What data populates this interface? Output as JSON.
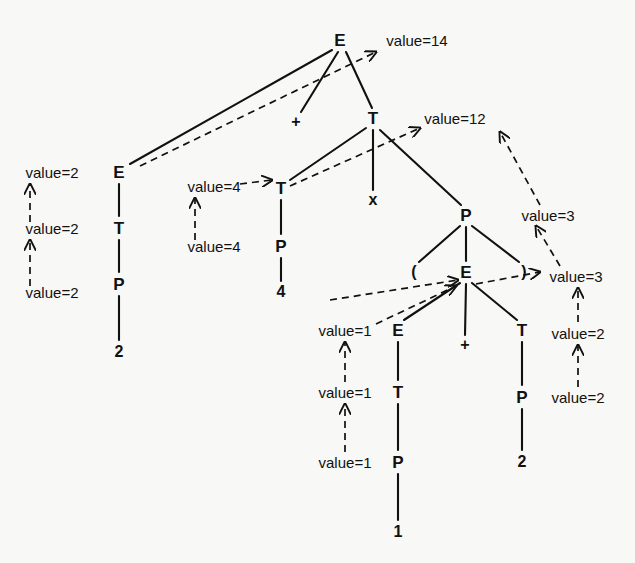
{
  "diagram": {
    "background_color": "#f8f8f6",
    "ink_color": "#111111"
  },
  "nodes": [
    {
      "id": "n1",
      "label": "E",
      "kind": "nonterminal",
      "x": 340,
      "y": 40
    },
    {
      "id": "n2",
      "label": "E",
      "kind": "nonterminal",
      "x": 119,
      "y": 172
    },
    {
      "id": "n3",
      "label": "+",
      "kind": "terminal",
      "x": 296,
      "y": 122
    },
    {
      "id": "n4",
      "label": "T",
      "kind": "nonterminal",
      "x": 373,
      "y": 118
    },
    {
      "id": "n5",
      "label": "T",
      "kind": "nonterminal",
      "x": 119,
      "y": 228
    },
    {
      "id": "n6",
      "label": "P",
      "kind": "nonterminal",
      "x": 119,
      "y": 284
    },
    {
      "id": "n7",
      "label": "2",
      "kind": "terminal",
      "x": 119,
      "y": 352
    },
    {
      "id": "n8",
      "label": "T",
      "kind": "nonterminal",
      "x": 281,
      "y": 188
    },
    {
      "id": "n9",
      "label": "x",
      "kind": "terminal",
      "x": 373,
      "y": 200
    },
    {
      "id": "n10",
      "label": "P",
      "kind": "nonterminal",
      "x": 466,
      "y": 215
    },
    {
      "id": "n11",
      "label": "P",
      "kind": "nonterminal",
      "x": 281,
      "y": 246
    },
    {
      "id": "n12",
      "label": "4",
      "kind": "terminal",
      "x": 281,
      "y": 292
    },
    {
      "id": "n13",
      "label": "(",
      "kind": "terminal",
      "x": 414,
      "y": 272
    },
    {
      "id": "n14",
      "label": "E",
      "kind": "nonterminal",
      "x": 466,
      "y": 272
    },
    {
      "id": "n15",
      "label": ")",
      "kind": "terminal",
      "x": 524,
      "y": 272
    },
    {
      "id": "n16",
      "label": "E",
      "kind": "nonterminal",
      "x": 398,
      "y": 330
    },
    {
      "id": "n17",
      "label": "+",
      "kind": "terminal",
      "x": 465,
      "y": 345
    },
    {
      "id": "n18",
      "label": "T",
      "kind": "nonterminal",
      "x": 522,
      "y": 330
    },
    {
      "id": "n19",
      "label": "T",
      "kind": "nonterminal",
      "x": 398,
      "y": 392
    },
    {
      "id": "n20",
      "label": "P",
      "kind": "nonterminal",
      "x": 522,
      "y": 397
    },
    {
      "id": "n21",
      "label": "P",
      "kind": "nonterminal",
      "x": 398,
      "y": 462
    },
    {
      "id": "n22",
      "label": "2",
      "kind": "terminal",
      "x": 522,
      "y": 462
    },
    {
      "id": "n23",
      "label": "1",
      "kind": "terminal",
      "x": 398,
      "y": 532
    }
  ],
  "annotations": [
    {
      "id": "a1",
      "text": "value=14",
      "x": 417,
      "y": 40
    },
    {
      "id": "a2",
      "text": "value=12",
      "x": 455,
      "y": 118
    },
    {
      "id": "a3",
      "text": "value=2",
      "x": 52,
      "y": 172
    },
    {
      "id": "a4",
      "text": "value=2",
      "x": 52,
      "y": 228
    },
    {
      "id": "a5",
      "text": "value=2",
      "x": 52,
      "y": 292
    },
    {
      "id": "a6",
      "text": "value=4",
      "x": 214,
      "y": 186
    },
    {
      "id": "a7",
      "text": "value=4",
      "x": 214,
      "y": 246
    },
    {
      "id": "a8",
      "text": "value=3",
      "x": 548,
      "y": 215
    },
    {
      "id": "a9",
      "text": "value=3",
      "x": 576,
      "y": 276
    },
    {
      "id": "a10",
      "text": "value=1",
      "x": 345,
      "y": 330
    },
    {
      "id": "a11",
      "text": "value=2",
      "x": 578,
      "y": 333
    },
    {
      "id": "a12",
      "text": "value=1",
      "x": 345,
      "y": 392
    },
    {
      "id": "a13",
      "text": "value=2",
      "x": 578,
      "y": 397
    },
    {
      "id": "a14",
      "text": "value=1",
      "x": 345,
      "y": 462
    }
  ],
  "tree_edges": [
    {
      "from": "n1",
      "to": "n2",
      "x1": 332,
      "y1": 50,
      "x2": 130,
      "y2": 164
    },
    {
      "from": "n1",
      "to": "n3",
      "x1": 338,
      "y1": 52,
      "x2": 301,
      "y2": 112
    },
    {
      "from": "n1",
      "to": "n4",
      "x1": 346,
      "y1": 52,
      "x2": 372,
      "y2": 108
    },
    {
      "from": "n2",
      "to": "n5",
      "x1": 119,
      "y1": 184,
      "x2": 119,
      "y2": 216
    },
    {
      "from": "n5",
      "to": "n6",
      "x1": 119,
      "y1": 240,
      "x2": 119,
      "y2": 272
    },
    {
      "from": "n6",
      "to": "n7",
      "x1": 119,
      "y1": 296,
      "x2": 119,
      "y2": 340
    },
    {
      "from": "n4",
      "to": "n8",
      "x1": 366,
      "y1": 128,
      "x2": 290,
      "y2": 180
    },
    {
      "from": "n4",
      "to": "n9",
      "x1": 373,
      "y1": 130,
      "x2": 373,
      "y2": 190
    },
    {
      "from": "n4",
      "to": "n10",
      "x1": 380,
      "y1": 130,
      "x2": 461,
      "y2": 205
    },
    {
      "from": "n8",
      "to": "n11",
      "x1": 281,
      "y1": 200,
      "x2": 281,
      "y2": 234
    },
    {
      "from": "n11",
      "to": "n12",
      "x1": 281,
      "y1": 258,
      "x2": 281,
      "y2": 281
    },
    {
      "from": "n10",
      "to": "n13",
      "x1": 460,
      "y1": 226,
      "x2": 419,
      "y2": 262
    },
    {
      "from": "n10",
      "to": "n14",
      "x1": 466,
      "y1": 227,
      "x2": 466,
      "y2": 261
    },
    {
      "from": "n10",
      "to": "n15",
      "x1": 472,
      "y1": 226,
      "x2": 519,
      "y2": 262
    },
    {
      "from": "n14",
      "to": "n16",
      "x1": 460,
      "y1": 283,
      "x2": 404,
      "y2": 320
    },
    {
      "from": "n14",
      "to": "n17",
      "x1": 466,
      "y1": 284,
      "x2": 465,
      "y2": 335
    },
    {
      "from": "n14",
      "to": "n18",
      "x1": 472,
      "y1": 283,
      "x2": 517,
      "y2": 320
    },
    {
      "from": "n16",
      "to": "n19",
      "x1": 398,
      "y1": 342,
      "x2": 398,
      "y2": 380
    },
    {
      "from": "n19",
      "to": "n21",
      "x1": 398,
      "y1": 404,
      "x2": 398,
      "y2": 450
    },
    {
      "from": "n21",
      "to": "n23",
      "x1": 398,
      "y1": 474,
      "x2": 398,
      "y2": 520
    },
    {
      "from": "n18",
      "to": "n20",
      "x1": 522,
      "y1": 342,
      "x2": 522,
      "y2": 385
    },
    {
      "from": "n20",
      "to": "n22",
      "x1": 522,
      "y1": 409,
      "x2": 522,
      "y2": 450
    }
  ],
  "attribute_arrows": [
    {
      "id": "d1",
      "x1": 30,
      "y1": 286,
      "x2": 30,
      "y2": 240,
      "note": "value=2 P to value=2 T"
    },
    {
      "id": "d2",
      "x1": 30,
      "y1": 222,
      "x2": 30,
      "y2": 184,
      "note": "value=2 T to value=2 E"
    },
    {
      "id": "d3",
      "x1": 140,
      "y1": 166,
      "x2": 376,
      "y2": 52,
      "note": "left E value up to root E"
    },
    {
      "id": "d4",
      "x1": 195,
      "y1": 240,
      "x2": 195,
      "y2": 198,
      "note": "value=4 P to value=4 T"
    },
    {
      "id": "d5",
      "x1": 240,
      "y1": 184,
      "x2": 272,
      "y2": 180,
      "note": "value=4 to T node"
    },
    {
      "id": "d6",
      "x1": 290,
      "y1": 186,
      "x2": 420,
      "y2": 128,
      "note": "T subtotal to value=12"
    },
    {
      "id": "d7",
      "x1": 540,
      "y1": 205,
      "x2": 500,
      "y2": 132,
      "note": "value=3 up to value=12"
    },
    {
      "id": "d8",
      "x1": 560,
      "y1": 266,
      "x2": 536,
      "y2": 226,
      "note": "value=3 up to value=3"
    },
    {
      "id": "d9",
      "x1": 578,
      "y1": 322,
      "x2": 578,
      "y2": 288,
      "note": "value=2 to value=3"
    },
    {
      "id": "d10",
      "x1": 578,
      "y1": 387,
      "x2": 578,
      "y2": 345,
      "note": "value=2 to value=2"
    },
    {
      "id": "d11",
      "x1": 345,
      "y1": 452,
      "x2": 345,
      "y2": 404,
      "note": "value=1 P to value=1 T"
    },
    {
      "id": "d12",
      "x1": 345,
      "y1": 382,
      "x2": 345,
      "y2": 342,
      "note": "value=1 T to value=1 E"
    },
    {
      "id": "d13",
      "x1": 376,
      "y1": 324,
      "x2": 456,
      "y2": 286,
      "note": "inner E value into E node"
    },
    {
      "id": "d14",
      "x1": 476,
      "y1": 284,
      "x2": 540,
      "y2": 272,
      "note": "inner E result out to value=3"
    },
    {
      "id": "d15",
      "x1": 330,
      "y1": 300,
      "x2": 458,
      "y2": 280,
      "note": "long dashed feed to inner E"
    }
  ]
}
